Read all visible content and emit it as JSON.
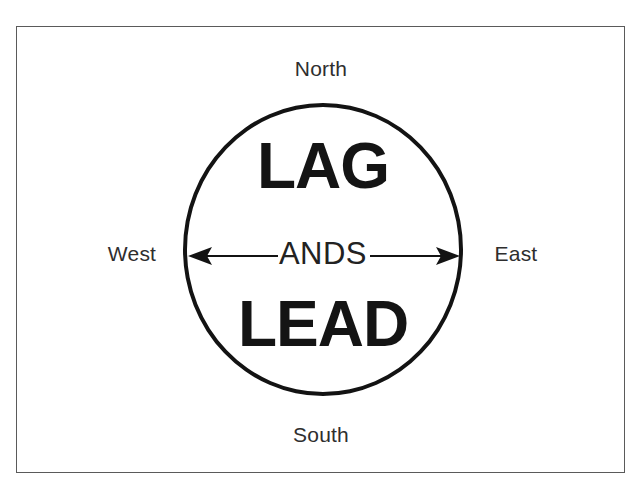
{
  "diagram": {
    "frame": {
      "border_color": "#5a5a5a"
    },
    "circle": {
      "name": "main-circle",
      "stroke_color": "#131313"
    },
    "compass": {
      "north": "North",
      "south": "South",
      "west": "West",
      "east": "East"
    },
    "words": {
      "top": "LAG",
      "middle": "ANDS",
      "bottom": "LEAD"
    },
    "arrows": {
      "left": {
        "icon": "arrow-left-icon",
        "direction": "left",
        "color": "#131313"
      },
      "right": {
        "icon": "arrow-right-icon",
        "direction": "right",
        "color": "#131313"
      }
    }
  }
}
